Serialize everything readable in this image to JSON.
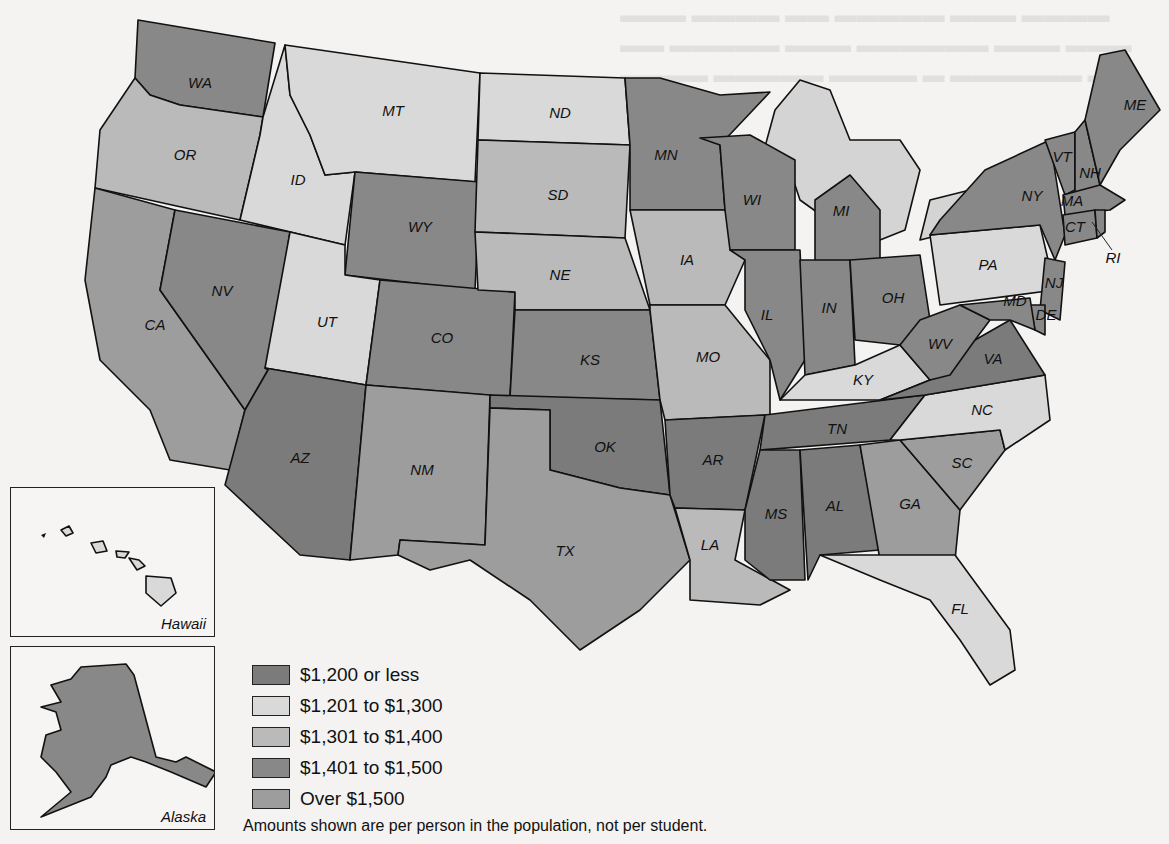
{
  "map": {
    "subject": "Per capita state and local spending by state",
    "categories": [
      {
        "id": "c1",
        "label": "$1,200 or less",
        "color": "#7b7b7b"
      },
      {
        "id": "c2",
        "label": "$1,201 to $1,300",
        "color": "#d9d9d9"
      },
      {
        "id": "c3",
        "label": "$1,301 to $1,400",
        "color": "#bababa"
      },
      {
        "id": "c4",
        "label": "$1,401 to $1,500",
        "color": "#888888"
      },
      {
        "id": "c5",
        "label": "Over $1,500",
        "color": "#9d9d9d"
      }
    ],
    "note": "Amounts shown are per person in the population, not per student.",
    "insets": {
      "hawaii": "Hawaii",
      "alaska": "Alaska"
    },
    "states": {
      "WA": "WA",
      "OR": "OR",
      "CA": "CA",
      "ID": "ID",
      "NV": "NV",
      "MT": "MT",
      "WY": "WY",
      "UT": "UT",
      "CO": "CO",
      "AZ": "AZ",
      "NM": "NM",
      "ND": "ND",
      "SD": "SD",
      "NE": "NE",
      "KS": "KS",
      "OK": "OK",
      "TX": "TX",
      "MN": "MN",
      "IA": "IA",
      "MO": "MO",
      "AR": "AR",
      "LA": "LA",
      "WI": "WI",
      "IL": "IL",
      "MI": "MI",
      "IN": "IN",
      "OH": "OH",
      "KY": "KY",
      "TN": "TN",
      "MS": "MS",
      "AL": "AL",
      "GA": "GA",
      "FL": "FL",
      "SC": "SC",
      "NC": "NC",
      "VA": "VA",
      "WV": "WV",
      "PA": "PA",
      "NY": "NY",
      "VT": "VT",
      "NH": "NH",
      "ME": "ME",
      "MA": "MA",
      "CT": "CT",
      "RI": "RI",
      "NJ": "NJ",
      "DE": "DE",
      "MD": "MD"
    }
  },
  "background_bleed": "faint reverse-side printed text (illegible)"
}
